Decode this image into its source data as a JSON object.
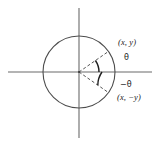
{
  "figure": {
    "name": "unit-circle-angle-symmetry",
    "background_color": "#ffffff",
    "stroke_color": "#5a5a5a",
    "text_color": "#1a1a1a",
    "labels": {
      "point_upper": "(x, y)",
      "angle_positive": "θ",
      "angle_negative": "−θ",
      "point_lower": "(x, −y)"
    },
    "geometry": {
      "center_x": 79,
      "center_y": 72,
      "radius": 36,
      "x_axis_start": 8,
      "x_axis_end": 152,
      "y_axis_start": 8,
      "y_axis_end": 138,
      "angle_degrees": 35,
      "arc_radius_upper": 20,
      "arc_radius_lower": 23
    }
  }
}
